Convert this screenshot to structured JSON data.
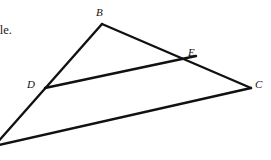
{
  "canvas": {
    "width": 271,
    "height": 160,
    "background_color": "#ffffff",
    "stroke_color": "#111111",
    "text_color": "#1a1a1a"
  },
  "text_block": {
    "note": "body text clipped by the left edge of the screenshot",
    "lines": [
      "r",
      "riangle.",
      "e"
    ]
  },
  "figure": {
    "type": "geometry-diagram",
    "points": [
      {
        "name": "B",
        "label": "B",
        "x": 102,
        "y": 24,
        "label_x": 96,
        "label_y": 7
      },
      {
        "name": "E",
        "label": "E",
        "x": 184,
        "y": 61,
        "label_x": 188,
        "label_y": 47
      },
      {
        "name": "C",
        "label": "C",
        "x": 251,
        "y": 88,
        "label_x": 255,
        "label_y": 79
      },
      {
        "name": "D",
        "label": "D",
        "x": 45,
        "y": 88,
        "label_x": 27,
        "label_y": 79
      },
      {
        "name": "A",
        "label": "",
        "x": -4,
        "y": 144,
        "label_x": 0,
        "label_y": 0
      }
    ],
    "segments": [
      {
        "name": "segment-B-C",
        "from": "B",
        "to": "C"
      },
      {
        "name": "segment-A-B",
        "from": "A",
        "to": "B"
      },
      {
        "name": "segment-A-C",
        "from": "A",
        "to": "C"
      },
      {
        "name": "segment-D-E",
        "from": "D",
        "to": "E"
      },
      {
        "name": "segment-E-C-extension",
        "from": "E",
        "to": "C"
      }
    ],
    "stroke_width": 2.4
  }
}
